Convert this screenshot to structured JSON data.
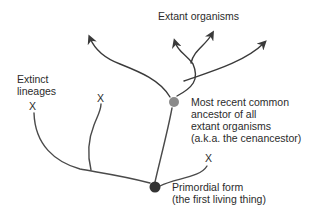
{
  "diagram": {
    "type": "phylogenetic-tree",
    "colors": {
      "line": "#3a3a3a",
      "cenancestor_node": "#8a8a8a",
      "primordial_node": "#333333",
      "text": "#2b2b2b"
    },
    "labels": {
      "extant_organisms": "Extant organisms",
      "extinct_lineages_line1": "Extinct",
      "extinct_lineages_line2": "lineages",
      "cenancestor_line1": "Most recent common",
      "cenancestor_line2": "ancestor of all",
      "cenancestor_line3": "extant organisms",
      "cenancestor_line4": "(a.k.a. the cenancestor)",
      "primordial_line1": "Primordial form",
      "primordial_line2": "(the first living thing)"
    },
    "extinction_marks": [
      {
        "symbol": "X",
        "branch": "far-left"
      },
      {
        "symbol": "X",
        "branch": "left"
      },
      {
        "symbol": "X",
        "branch": "right-of-primordial"
      }
    ],
    "nodes": [
      {
        "name": "cenancestor",
        "label_ref": "cenancestor"
      },
      {
        "name": "primordial-form",
        "label_ref": "primordial"
      }
    ],
    "extant_branches": 4
  }
}
